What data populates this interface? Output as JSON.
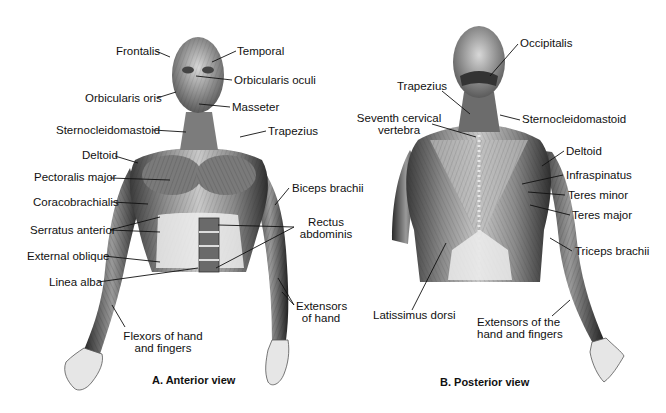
{
  "figure": {
    "anterior": {
      "caption": "A. Anterior view",
      "labels": {
        "frontalis": "Frontalis",
        "temporal": "Temporal",
        "orbicularis_oculi": "Orbicularis oculi",
        "orbicularis_oris": "Orbicularis oris",
        "masseter": "Masseter",
        "sternocleidomastoid": "Sternocleidomastoid",
        "trapezius": "Trapezius",
        "deltoid": "Deltoid",
        "pectoralis_major": "Pectoralis major",
        "biceps_brachii": "Biceps brachii",
        "coracobrachialis": "Coracobrachialis",
        "serratus_anterior": "Serratus anterior",
        "rectus_abdominis_1": "Rectus",
        "rectus_abdominis_2": "abdominis",
        "external_oblique": "External oblique",
        "linea_alba": "Linea alba",
        "extensors_of_hand_1": "Extensors",
        "extensors_of_hand_2": "of hand",
        "flexors_1": "Flexors of hand",
        "flexors_2": "and fingers"
      }
    },
    "posterior": {
      "caption": "B. Posterior view",
      "labels": {
        "occipitalis": "Occipitalis",
        "trapezius": "Trapezius",
        "seventh_cervical_1": "Seventh cervical",
        "seventh_cervical_2": "vertebra",
        "sternocleidomastoid": "Sternocleidomastoid",
        "deltoid": "Deltoid",
        "infraspinatus": "Infraspinatus",
        "teres_minor": "Teres minor",
        "teres_major": "Teres major",
        "triceps_brachii": "Triceps brachii",
        "latissimus_dorsi": "Latissimus dorsi",
        "extensors_1": "Extensors of the",
        "extensors_2": "hand and fingers"
      }
    }
  }
}
